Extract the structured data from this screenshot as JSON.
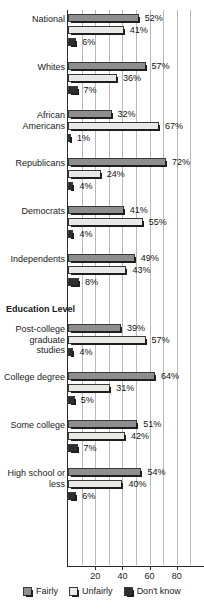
{
  "chart_data": {
    "type": "bar",
    "orientation": "horizontal",
    "title": "",
    "subtitle": "",
    "xlabel": "",
    "ylabel": "",
    "xlim": [
      0,
      100
    ],
    "xticks": [
      20,
      40,
      60,
      80
    ],
    "xticklabels": [
      "20",
      "40",
      "60",
      "80"
    ],
    "gridlines": true,
    "gridline_step": 10,
    "legend_position": "bottom",
    "categories": [
      "National",
      "Whites",
      "African Americans",
      "Republicans",
      "Democrats",
      "Independents",
      "Post-college graduate studies",
      "College degree",
      "Some college",
      "High school or less"
    ],
    "group_headers": [
      {
        "label": "Education Level",
        "before_category": "Post-college graduate studies"
      }
    ],
    "series": [
      {
        "name": "Fairly",
        "color": "#8e8e8e",
        "values": [
          52,
          57,
          32,
          72,
          41,
          49,
          39,
          64,
          51,
          54
        ],
        "value_labels": [
          "52%",
          "57%",
          "32%",
          "72%",
          "41%",
          "49%",
          "39%",
          "64%",
          "51%",
          "54%"
        ]
      },
      {
        "name": "Unfairly",
        "color": "#e8e8e6",
        "values": [
          41,
          36,
          67,
          24,
          55,
          43,
          57,
          31,
          42,
          40
        ],
        "value_labels": [
          "41%",
          "36%",
          "67%",
          "24%",
          "55%",
          "43%",
          "57%",
          "31%",
          "42%",
          "40%"
        ]
      },
      {
        "name": "Don't know",
        "color": "#2e2e2e",
        "values": [
          6,
          7,
          1,
          4,
          4,
          8,
          4,
          5,
          7,
          6
        ],
        "value_labels": [
          "6%",
          "7%",
          "1%",
          "4%",
          "4%",
          "8%",
          "4%",
          "5%",
          "7%",
          "6%"
        ]
      }
    ]
  },
  "legend": {
    "items": [
      {
        "label": "Fairly"
      },
      {
        "label": "Unfairly"
      },
      {
        "label": "Don't know"
      }
    ]
  }
}
